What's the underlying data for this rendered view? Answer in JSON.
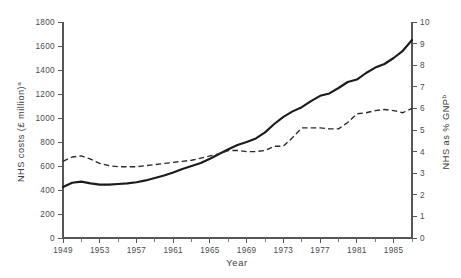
{
  "chart_data": {
    "type": "line",
    "title": "",
    "xlabel": "Year",
    "ylabel": "NHS costs  (£ million)",
    "ylabel_superscript": "a",
    "y2label": "NHS as % GNP",
    "y2label_superscript": "b",
    "xlim": [
      1949,
      1987
    ],
    "ylim": [
      0,
      1800
    ],
    "y2lim": [
      0,
      10
    ],
    "grid": false,
    "legend": "none",
    "x_ticks": [
      1949,
      1953,
      1957,
      1961,
      1965,
      1969,
      1973,
      1977,
      1981,
      1985
    ],
    "x_tick_labels": [
      "1949",
      "1953",
      "1957",
      "1961",
      "1965",
      "1969",
      "1973",
      "1977",
      "1981",
      "1985"
    ],
    "x_minor_tick_interval": 2,
    "y_ticks": [
      0,
      200,
      400,
      600,
      800,
      1000,
      1200,
      1400,
      1600,
      1800
    ],
    "y_tick_labels": [
      "0",
      "200",
      "400",
      "600",
      "800",
      "1000",
      "1200",
      "1400",
      "1600",
      "1800"
    ],
    "y2_ticks": [
      0,
      1,
      2,
      3,
      4,
      5,
      6,
      7,
      8,
      9,
      10
    ],
    "y2_tick_labels": [
      "0",
      "1",
      "2",
      "3",
      "4",
      "5",
      "6",
      "7",
      "8",
      "9",
      "10"
    ],
    "x": [
      1949,
      1950,
      1951,
      1952,
      1953,
      1954,
      1955,
      1956,
      1957,
      1958,
      1959,
      1960,
      1961,
      1962,
      1963,
      1964,
      1965,
      1966,
      1967,
      1968,
      1969,
      1970,
      1971,
      1972,
      1973,
      1974,
      1975,
      1976,
      1977,
      1978,
      1979,
      1980,
      1981,
      1982,
      1983,
      1984,
      1985,
      1986,
      1987
    ],
    "series": [
      {
        "name": "NHS costs (£ million)",
        "axis": "left",
        "style": "solid",
        "values": [
          425,
          460,
          470,
          455,
          445,
          445,
          450,
          455,
          465,
          480,
          500,
          520,
          545,
          575,
          600,
          625,
          660,
          700,
          740,
          775,
          800,
          830,
          880,
          950,
          1010,
          1055,
          1090,
          1140,
          1185,
          1205,
          1250,
          1300,
          1320,
          1375,
          1420,
          1450,
          1500,
          1560,
          1650
        ]
      },
      {
        "name": "NHS as % GNP",
        "axis": "right",
        "style": "dashed",
        "values": [
          3.55,
          3.75,
          3.8,
          3.65,
          3.45,
          3.35,
          3.3,
          3.3,
          3.3,
          3.35,
          3.4,
          3.45,
          3.5,
          3.55,
          3.6,
          3.7,
          3.8,
          3.9,
          4.05,
          4.05,
          4.0,
          4.0,
          4.05,
          4.25,
          4.25,
          4.65,
          5.1,
          5.1,
          5.1,
          5.05,
          5.05,
          5.35,
          5.75,
          5.8,
          5.9,
          5.95,
          5.9,
          5.8,
          6.0
        ]
      }
    ]
  }
}
